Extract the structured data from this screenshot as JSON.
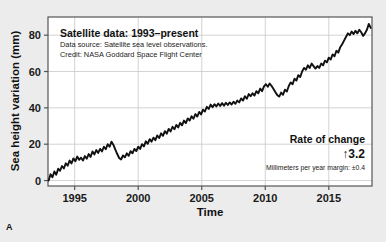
{
  "panel": {
    "letter": "A"
  },
  "header": {
    "title": "Satellite data: 1993–present",
    "source_line": "Data source: Satellite sea level observations.",
    "credit_line": "Credit: NASA Goddard Space Flight Center"
  },
  "rate": {
    "title": "Rate of change",
    "arrow": "↑",
    "value": "3.2",
    "margin": "Millimeters per year margin: ±0.4"
  },
  "colors": {
    "page_background": "#ececec",
    "plot_background": "#ffffff",
    "line": "#111111",
    "grid": "#c8c8c8",
    "axis": "#555555",
    "text": "#111111"
  },
  "chart_data": {
    "type": "line",
    "title": "Satellite data: 1993–present",
    "xlabel": "Time",
    "ylabel": "Sea height variation (mm)",
    "xlim": [
      1992.9,
      2018.4
    ],
    "ylim": [
      -3,
      90
    ],
    "xticks": [
      1995,
      2000,
      2005,
      2010,
      2015
    ],
    "yticks": [
      0,
      20,
      40,
      60,
      80
    ],
    "grid": true,
    "legend": "none",
    "series": [
      {
        "name": "Sea height variation",
        "x": [
          1992.95,
          1993.1,
          1993.25,
          1993.4,
          1993.55,
          1993.7,
          1993.85,
          1994.0,
          1994.15,
          1994.3,
          1994.45,
          1994.6,
          1994.75,
          1994.9,
          1995.05,
          1995.2,
          1995.35,
          1995.5,
          1995.65,
          1995.8,
          1995.95,
          1996.1,
          1996.25,
          1996.4,
          1996.55,
          1996.7,
          1996.85,
          1997.0,
          1997.15,
          1997.3,
          1997.45,
          1997.6,
          1997.75,
          1997.9,
          1998.05,
          1998.2,
          1998.35,
          1998.5,
          1998.65,
          1998.8,
          1998.95,
          1999.1,
          1999.25,
          1999.4,
          1999.55,
          1999.7,
          1999.85,
          2000.0,
          2000.15,
          2000.3,
          2000.45,
          2000.6,
          2000.75,
          2000.9,
          2001.05,
          2001.2,
          2001.35,
          2001.5,
          2001.65,
          2001.8,
          2001.95,
          2002.1,
          2002.25,
          2002.4,
          2002.55,
          2002.7,
          2002.85,
          2003.0,
          2003.15,
          2003.3,
          2003.45,
          2003.6,
          2003.75,
          2003.9,
          2004.05,
          2004.2,
          2004.35,
          2004.5,
          2004.65,
          2004.8,
          2004.95,
          2005.1,
          2005.25,
          2005.4,
          2005.55,
          2005.7,
          2005.85,
          2006.0,
          2006.15,
          2006.3,
          2006.45,
          2006.6,
          2006.75,
          2006.9,
          2007.05,
          2007.2,
          2007.35,
          2007.5,
          2007.65,
          2007.8,
          2007.95,
          2008.1,
          2008.25,
          2008.4,
          2008.55,
          2008.7,
          2008.85,
          2009.0,
          2009.15,
          2009.3,
          2009.45,
          2009.6,
          2009.75,
          2009.9,
          2010.05,
          2010.2,
          2010.35,
          2010.5,
          2010.65,
          2010.8,
          2010.95,
          2011.1,
          2011.25,
          2011.4,
          2011.55,
          2011.7,
          2011.85,
          2012.0,
          2012.15,
          2012.3,
          2012.45,
          2012.6,
          2012.75,
          2012.9,
          2013.05,
          2013.2,
          2013.35,
          2013.5,
          2013.65,
          2013.8,
          2013.95,
          2014.1,
          2014.25,
          2014.4,
          2014.55,
          2014.7,
          2014.85,
          2015.0,
          2015.15,
          2015.3,
          2015.45,
          2015.6,
          2015.75,
          2015.9,
          2016.05,
          2016.2,
          2016.35,
          2016.5,
          2016.65,
          2016.8,
          2016.95,
          2017.1,
          2017.25,
          2017.4,
          2017.55,
          2017.7,
          2017.85,
          2018.0,
          2018.15,
          2018.3
        ],
        "y": [
          0.0,
          3.5,
          1.8,
          5.0,
          3.2,
          6.5,
          5.4,
          8.0,
          6.6,
          9.5,
          8.2,
          11.0,
          9.4,
          12.2,
          10.6,
          13.2,
          11.4,
          12.6,
          11.0,
          13.5,
          12.0,
          14.6,
          13.0,
          16.0,
          14.4,
          16.8,
          15.2,
          17.4,
          16.0,
          18.6,
          17.2,
          20.0,
          18.6,
          21.4,
          19.6,
          17.0,
          14.6,
          12.4,
          11.6,
          13.8,
          12.8,
          15.0,
          13.6,
          16.2,
          15.0,
          17.4,
          16.2,
          18.6,
          17.4,
          20.0,
          18.8,
          21.6,
          20.2,
          22.8,
          21.4,
          23.6,
          22.2,
          24.8,
          23.4,
          26.0,
          24.6,
          27.2,
          25.8,
          28.4,
          27.0,
          29.6,
          28.2,
          30.6,
          29.2,
          31.8,
          30.4,
          33.0,
          31.6,
          34.2,
          33.0,
          35.4,
          34.0,
          36.6,
          35.2,
          37.8,
          36.4,
          39.0,
          38.0,
          40.6,
          39.4,
          41.8,
          40.4,
          42.0,
          40.8,
          42.4,
          41.0,
          42.6,
          41.2,
          42.8,
          41.6,
          43.0,
          41.8,
          43.4,
          42.2,
          44.0,
          43.0,
          45.2,
          44.0,
          46.4,
          45.0,
          47.6,
          46.4,
          48.0,
          46.8,
          49.2,
          48.0,
          50.6,
          49.2,
          51.8,
          53.0,
          51.6,
          53.4,
          52.0,
          50.4,
          48.6,
          47.0,
          46.2,
          48.4,
          47.2,
          50.0,
          49.0,
          52.0,
          54.0,
          53.0,
          56.0,
          55.0,
          58.0,
          57.0,
          60.0,
          62.0,
          61.0,
          63.4,
          62.0,
          64.4,
          63.0,
          61.6,
          63.0,
          62.0,
          64.4,
          63.4,
          66.0,
          65.0,
          67.6,
          66.6,
          69.4,
          68.4,
          71.4,
          70.4,
          73.4,
          75.0,
          77.0,
          79.0,
          81.0,
          80.0,
          82.0,
          80.6,
          82.4,
          81.0,
          83.0,
          81.6,
          79.6,
          81.0,
          83.0,
          86.2,
          84.0
        ]
      }
    ],
    "annotations": [
      {
        "text": "Satellite data: 1993–present",
        "kind": "title"
      },
      {
        "text": "Data source: Satellite sea level observations.",
        "kind": "subtitle"
      },
      {
        "text": "Credit: NASA Goddard Space Flight Center",
        "kind": "subtitle"
      },
      {
        "text": "Rate of change",
        "kind": "callout-title"
      },
      {
        "text": "↑3.2",
        "kind": "callout-value"
      },
      {
        "text": "Millimeters per year margin: ±0.4",
        "kind": "callout-note"
      }
    ]
  }
}
